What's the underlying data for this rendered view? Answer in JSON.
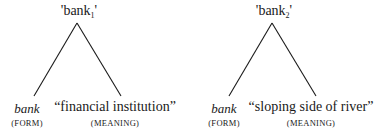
{
  "trees": [
    {
      "title": "'bank",
      "subscript": "1",
      "title_close": "'",
      "form": {
        "word": "bank",
        "label": "(FORM)"
      },
      "meaning": {
        "word": "“financial institution”",
        "label": "(MEANING)"
      }
    },
    {
      "title": "'bank",
      "subscript": "2",
      "title_close": "'",
      "form": {
        "word": "bank",
        "label": "(FORM)"
      },
      "meaning": {
        "word": "“sloping side of river”",
        "label": "(MEANING)"
      }
    }
  ],
  "colors": {
    "ink": "#1a1a1a",
    "background": "#ffffff"
  }
}
